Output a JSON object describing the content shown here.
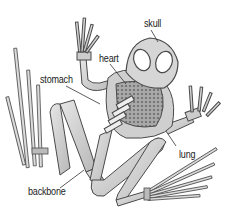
{
  "diagram": {
    "labels": [
      {
        "id": "skull",
        "text": "skull",
        "x": 144,
        "y": 19
      },
      {
        "id": "heart",
        "text": "heart",
        "x": 99,
        "y": 54
      },
      {
        "id": "stomach",
        "text": "stomach",
        "x": 40,
        "y": 75
      },
      {
        "id": "lung",
        "text": "lung",
        "x": 179,
        "y": 150
      },
      {
        "id": "backbone",
        "text": "backbone",
        "x": 28,
        "y": 187
      }
    ],
    "colors": {
      "background": "#ffffff",
      "bone_fill": "#d4d4d4",
      "bone_stroke": "#4a4a4a",
      "organ_fill": "#9a9a9a",
      "text": "#222222"
    }
  }
}
